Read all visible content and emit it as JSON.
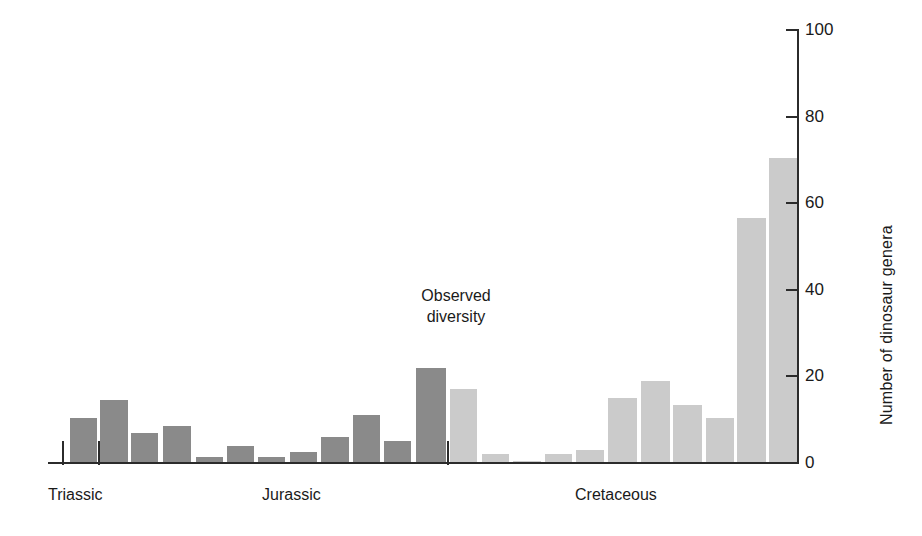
{
  "chart_data": {
    "type": "bar",
    "title": "",
    "annotation": {
      "line1": "Observed",
      "line2": "diversity"
    },
    "xlabel": "",
    "ylabel": "Number of dinosaur genera",
    "ylim": [
      0,
      100
    ],
    "ytick_labels": [
      "100",
      "80",
      "60",
      "40",
      "20",
      "0"
    ],
    "ytick_values": [
      100,
      80,
      60,
      40,
      20,
      0
    ],
    "grid": false,
    "legend": "none",
    "period_labels": [
      "Triassic",
      "Jurassic",
      "Cretaceous"
    ],
    "colors": {
      "triassic_jurassic": "#8a8a8a",
      "cretaceous": "#cbcbcb",
      "axis": "#2b2b2b"
    },
    "categories": [
      "T1",
      "T2",
      "T3",
      "J1",
      "J2",
      "J3",
      "J4",
      "J5",
      "J6",
      "J7",
      "J8",
      "J9",
      "J10",
      "J11",
      "K1",
      "K2",
      "K3",
      "K4",
      "K5",
      "K6",
      "K7",
      "K8",
      "K9",
      "K10"
    ],
    "values": [
      10.5,
      14.5,
      7.0,
      8.5,
      1.5,
      4.0,
      1.5,
      2.5,
      6.0,
      11.0,
      5.0,
      22.0,
      17.0,
      2.0,
      0.5,
      2.0,
      3.0,
      15.0,
      19.0,
      13.5,
      10.5,
      56.5,
      70.5,
      0.0
    ],
    "bars": [
      {
        "name": "T1",
        "x": 70,
        "w": 27,
        "value": 10.5,
        "series": "triassic"
      },
      {
        "name": "T2",
        "x": 100,
        "w": 28,
        "value": 14.5,
        "series": "triassic"
      },
      {
        "name": "T3",
        "x": 131,
        "w": 27,
        "value": 7.0,
        "series": "triassic"
      },
      {
        "name": "J1",
        "x": 163,
        "w": 28,
        "value": 8.5,
        "series": "jurassic"
      },
      {
        "name": "J2",
        "x": 196,
        "w": 27,
        "value": 1.5,
        "series": "jurassic"
      },
      {
        "name": "J3",
        "x": 227,
        "w": 27,
        "value": 4.0,
        "series": "jurassic"
      },
      {
        "name": "J4",
        "x": 258,
        "w": 27,
        "value": 1.5,
        "series": "jurassic"
      },
      {
        "name": "J5",
        "x": 290,
        "w": 27,
        "value": 2.5,
        "series": "jurassic"
      },
      {
        "name": "J6",
        "x": 321,
        "w": 28,
        "value": 6.0,
        "series": "jurassic"
      },
      {
        "name": "J7",
        "x": 353,
        "w": 27,
        "value": 11.0,
        "series": "jurassic"
      },
      {
        "name": "J8",
        "x": 384,
        "w": 27,
        "value": 5.0,
        "series": "jurassic"
      },
      {
        "name": "J9",
        "x": 416,
        "w": 30,
        "value": 22.0,
        "series": "jurassic"
      },
      {
        "name": "K1",
        "x": 450,
        "w": 27,
        "value": 17.0,
        "series": "cretaceous"
      },
      {
        "name": "K2",
        "x": 482,
        "w": 27,
        "value": 2.0,
        "series": "cretaceous"
      },
      {
        "name": "K3",
        "x": 513,
        "w": 28,
        "value": 0.5,
        "series": "cretaceous"
      },
      {
        "name": "K4",
        "x": 545,
        "w": 27,
        "value": 2.0,
        "series": "cretaceous"
      },
      {
        "name": "K5",
        "x": 576,
        "w": 28,
        "value": 3.0,
        "series": "cretaceous"
      },
      {
        "name": "K6",
        "x": 608,
        "w": 29,
        "value": 15.0,
        "series": "cretaceous"
      },
      {
        "name": "K7",
        "x": 641,
        "w": 29,
        "value": 19.0,
        "series": "cretaceous"
      },
      {
        "name": "K8",
        "x": 673,
        "w": 29,
        "value": 13.5,
        "series": "cretaceous"
      },
      {
        "name": "K9",
        "x": 706,
        "w": 28,
        "value": 10.5,
        "series": "cretaceous"
      },
      {
        "name": "K10",
        "x": 737,
        "w": 29,
        "value": 56.5,
        "series": "cretaceous"
      },
      {
        "name": "K11",
        "x": 769,
        "w": 29,
        "value": 70.5,
        "series": "cretaceous"
      }
    ],
    "period_ticks": [
      62,
      98,
      447
    ],
    "period_label_positions": [
      {
        "label": "Triassic",
        "x": 48
      },
      {
        "label": "Jurassic",
        "x": 262
      },
      {
        "label": "Cretaceous",
        "x": 575
      }
    ]
  }
}
